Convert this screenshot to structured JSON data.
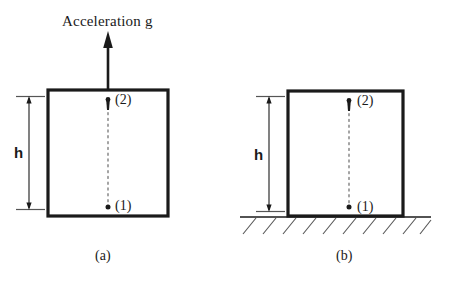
{
  "figure": {
    "title": "Acceleration g",
    "background_color": "#ffffff",
    "line_color": "#1a1a1a",
    "panels": [
      {
        "id": "a",
        "caption": "(a)",
        "dimension_label": "h",
        "point_upper_label": "(2)",
        "point_lower_label": "(1)",
        "has_acceleration_arrow": true,
        "has_ground_hatching": false,
        "box": {
          "x": 48,
          "y": 90,
          "width": 120,
          "height": 126
        }
      },
      {
        "id": "b",
        "caption": "(b)",
        "dimension_label": "h",
        "point_upper_label": "(2)",
        "point_lower_label": "(1)",
        "has_acceleration_arrow": false,
        "has_ground_hatching": true,
        "box": {
          "x": 288,
          "y": 91,
          "width": 115,
          "height": 125
        }
      }
    ],
    "annotations": {
      "arrow_name": "acceleration-arrow",
      "dotted_line_name": "height-dotted-line"
    }
  }
}
